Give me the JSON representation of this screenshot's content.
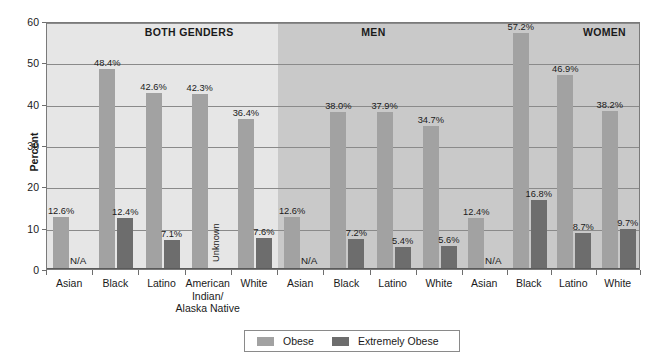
{
  "chart_data": {
    "type": "bar",
    "title": "",
    "xlabel": "",
    "ylabel": "Percent",
    "ylim": [
      0,
      60
    ],
    "ytick_step": 10,
    "yticks": [
      "0",
      "10",
      "20",
      "30",
      "40",
      "50",
      "60"
    ],
    "grid": true,
    "legend_position": "bottom-center",
    "legend": [
      {
        "name": "Obese",
        "color": "#a2a2a2"
      },
      {
        "name": "Extremely Obese",
        "color": "#6d6d6d"
      }
    ],
    "series": [
      {
        "name": "Obese",
        "color": "#a2a2a2"
      },
      {
        "name": "Extremely Obese",
        "color": "#6d6d6d"
      }
    ],
    "bands": [
      {
        "title": "BOTH GENDERS",
        "band_color": "#e6e6e6",
        "groups": [
          {
            "category": "Asian",
            "obese": 12.6,
            "obese_label": "12.6%",
            "extreme": null,
            "extreme_label": "N/A"
          },
          {
            "category": "Black",
            "obese": 48.4,
            "obese_label": "48.4%",
            "extreme": 12.4,
            "extreme_label": "12.4%"
          },
          {
            "category": "Latino",
            "obese": 42.6,
            "obese_label": "42.6%",
            "extreme": 7.1,
            "extreme_label": "7.1%"
          },
          {
            "category": "American Indian/ Alaska Native",
            "obese": 42.3,
            "obese_label": "42.3%",
            "extreme": null,
            "extreme_label": "Unknown"
          },
          {
            "category": "White",
            "obese": 36.4,
            "obese_label": "36.4%",
            "extreme": 7.6,
            "extreme_label": "7.6%"
          }
        ]
      },
      {
        "title": "MEN",
        "band_color": "#c9c9c9",
        "groups": [
          {
            "category": "Asian",
            "obese": 12.6,
            "obese_label": "12.6%",
            "extreme": null,
            "extreme_label": "N/A"
          },
          {
            "category": "Black",
            "obese": 38.0,
            "obese_label": "38.0%",
            "extreme": 7.2,
            "extreme_label": "7.2%"
          },
          {
            "category": "Latino",
            "obese": 37.9,
            "obese_label": "37.9%",
            "extreme": 5.4,
            "extreme_label": "5.4%"
          },
          {
            "category": "White",
            "obese": 34.7,
            "obese_label": "34.7%",
            "extreme": 5.6,
            "extreme_label": "5.6%"
          }
        ]
      },
      {
        "title": "WOMEN",
        "band_color": "#c9c9c9",
        "groups": [
          {
            "category": "Asian",
            "obese": 12.4,
            "obese_label": "12.4%",
            "extreme": null,
            "extreme_label": "N/A"
          },
          {
            "category": "Black",
            "obese": 57.2,
            "obese_label": "57.2%",
            "extreme": 16.8,
            "extreme_label": "16.8%"
          },
          {
            "category": "Latino",
            "obese": 46.9,
            "obese_label": "46.9%",
            "extreme": 8.7,
            "extreme_label": "8.7%"
          },
          {
            "category": "White",
            "obese": 38.2,
            "obese_label": "38.2%",
            "extreme": 9.7,
            "extreme_label": "9.7%"
          }
        ]
      }
    ]
  }
}
